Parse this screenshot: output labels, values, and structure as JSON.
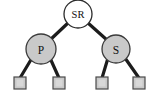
{
  "figure": {
    "type": "binary-tree-diagram",
    "title": "",
    "background_color": "#ffffff",
    "width": 153,
    "height": 112
  },
  "palette": {
    "edge_color": "#1c1c1c",
    "root_fill": "#ffffff",
    "node_fill": "#c9c9c9",
    "node_stroke": "#3a3a3a",
    "leaf_fill": "#c9c9c9",
    "leaf_stroke": "#4a4a4a",
    "label_color": "#111111"
  },
  "nodes": [
    {
      "id": "root",
      "label": "SR",
      "shape": "circle",
      "fill": "#ffffff",
      "cx": 78,
      "cy": 14,
      "r": 14
    },
    {
      "id": "left-internal",
      "label": "P",
      "shape": "circle",
      "fill": "#c9c9c9",
      "cx": 41,
      "cy": 49,
      "r": 15
    },
    {
      "id": "right-internal",
      "label": "S",
      "shape": "circle",
      "fill": "#c9c9c9",
      "cx": 116,
      "cy": 49,
      "r": 14
    },
    {
      "id": "leaf-1",
      "label": "",
      "shape": "square",
      "fill": "#c9c9c9",
      "x": 14,
      "y": 77,
      "size": 12
    },
    {
      "id": "leaf-2",
      "label": "",
      "shape": "square",
      "fill": "#c9c9c9",
      "x": 53,
      "y": 77,
      "size": 12
    },
    {
      "id": "leaf-3",
      "label": "",
      "shape": "square",
      "fill": "#c9c9c9",
      "x": 96,
      "y": 77,
      "size": 12
    },
    {
      "id": "leaf-4",
      "label": "",
      "shape": "square",
      "fill": "#c9c9c9",
      "x": 133,
      "y": 77,
      "size": 12
    }
  ],
  "edges": [
    {
      "from": "root",
      "to": "left-internal",
      "x1": 68,
      "y1": 23,
      "x2": 50,
      "y2": 40
    },
    {
      "from": "root",
      "to": "right-internal",
      "x1": 88,
      "y1": 23,
      "x2": 107,
      "y2": 40
    },
    {
      "from": "left-internal",
      "to": "leaf-1",
      "x1": 32,
      "y1": 58,
      "x2": 20,
      "y2": 77
    },
    {
      "from": "left-internal",
      "to": "leaf-2",
      "x1": 50,
      "y1": 58,
      "x2": 59,
      "y2": 77
    },
    {
      "from": "right-internal",
      "to": "leaf-3",
      "x1": 108,
      "y1": 58,
      "x2": 102,
      "y2": 77
    },
    {
      "from": "right-internal",
      "to": "leaf-4",
      "x1": 125,
      "y1": 58,
      "x2": 139,
      "y2": 77
    }
  ]
}
